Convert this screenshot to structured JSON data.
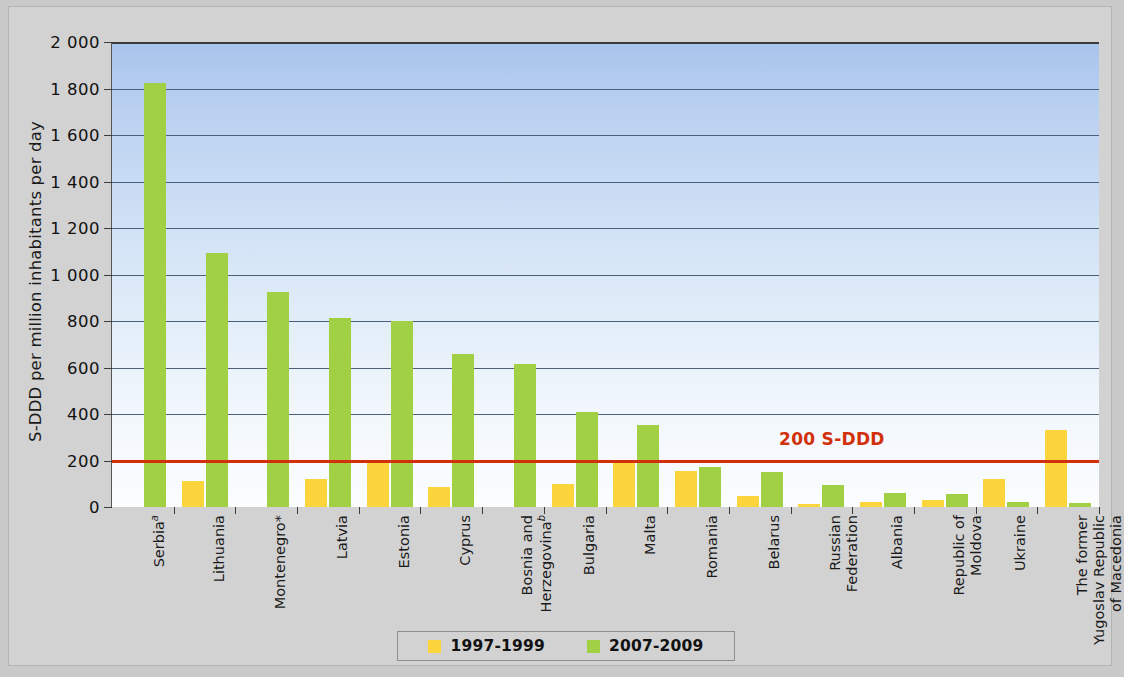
{
  "chart_data": {
    "type": "bar",
    "title": "",
    "subtitle": "",
    "xlabel": "",
    "ylabel": "S-DDD per million inhabitants per day",
    "ylim": [
      0,
      2000
    ],
    "ytick_labels": [
      "2 000",
      "1 800",
      "1 600",
      "1 400",
      "1 200",
      "1 000",
      "800",
      "600",
      "400",
      "200",
      "0"
    ],
    "ytick_values": [
      2000,
      1800,
      1600,
      1400,
      1200,
      1000,
      800,
      600,
      400,
      200,
      0
    ],
    "grid": true,
    "legend_position": "bottom",
    "categories": [
      "Serbiaᵃ",
      "Lithuania",
      "Montenegro*",
      "Latvia",
      "Estonia",
      "Cyprus",
      "Bosnia and Herzegovinaᵇ",
      "Bulgaria",
      "Malta",
      "Romania",
      "Belarus",
      "Russian Federation",
      "Albania",
      "Republic of Moldova",
      "Ukraine",
      "The former Yugoslav Republic of Macedonia"
    ],
    "category_lines": [
      [
        "Serbia"
      ],
      [
        "Lithuania"
      ],
      [
        "Montenegro*"
      ],
      [
        "Latvia"
      ],
      [
        "Estonia"
      ],
      [
        "Cyprus"
      ],
      [
        "Bosnia and",
        "Herzegovina"
      ],
      [
        "Bulgaria"
      ],
      [
        "Malta"
      ],
      [
        "Romania"
      ],
      [
        "Belarus"
      ],
      [
        "Russian",
        "Federation"
      ],
      [
        "Albania"
      ],
      [
        "Republic of",
        "Moldova"
      ],
      [
        "Ukraine"
      ],
      [
        "The former",
        "Yugoslav Republic",
        "of Macedonia"
      ]
    ],
    "category_superscripts": [
      "a",
      "",
      "",
      "",
      "",
      "",
      "b",
      "",
      "",
      "",
      "",
      "",
      "",
      "",
      "",
      ""
    ],
    "series": [
      {
        "name": "1997-1999",
        "color": "#fcd43c",
        "values": [
          0,
          112,
          0,
          122,
          190,
          88,
          0,
          98,
          190,
          155,
          48,
          12,
          22,
          32,
          120,
          330
        ]
      },
      {
        "name": "2007-2009",
        "color": "#a2d045",
        "values": [
          1825,
          1092,
          925,
          815,
          800,
          658,
          615,
          408,
          352,
          172,
          150,
          95,
          62,
          58,
          22,
          18
        ]
      }
    ],
    "annotations": [
      {
        "name": "threshold",
        "label": "200 S-DDD",
        "value": 200,
        "color": "#cc3300"
      }
    ],
    "colors": {
      "series_1997_1999": "#fcd43c",
      "series_2007_2009": "#a2d045",
      "threshold_line": "#d1300a",
      "gridline": "#4e5f7a",
      "plot_background_top": "#a9c4ec",
      "plot_background_bottom": "#fbfdff",
      "figure_background": "#d2d2d2"
    }
  },
  "legend": {
    "items": [
      {
        "label": "1997-1999",
        "color": "#fcd43c"
      },
      {
        "label": "2007-2009",
        "color": "#a2d045"
      }
    ]
  }
}
